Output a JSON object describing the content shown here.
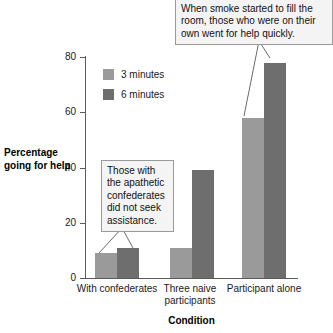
{
  "chart_data": {
    "type": "bar",
    "title": "",
    "xlabel": "Condition",
    "ylabel": "Percentage going for help",
    "categories": [
      "With confederates",
      "Three naive participants",
      "Participant alone"
    ],
    "series": [
      {
        "name": "3 minutes",
        "values": [
          9,
          11,
          58
        ],
        "color": "#9a9a9a"
      },
      {
        "name": "6 minutes",
        "values": [
          11,
          39,
          78
        ],
        "color": "#6e6e6e"
      }
    ],
    "ylim": [
      0,
      80
    ],
    "yticks": [
      0,
      20,
      40,
      60,
      80
    ],
    "ytick_labels": [
      "0",
      "20",
      "40",
      "60",
      "80"
    ],
    "grid": false,
    "legend_position": "upper-left-inside",
    "annotations": [
      {
        "id": "top",
        "text": "When smoke started to fill the room, those who were on their own went for help quickly.",
        "points_to": [
          "Participant alone / 3 minutes",
          "Participant alone / 6 minutes"
        ]
      },
      {
        "id": "bottom",
        "text": "Those with the apathetic confederates did not seek assistance.",
        "points_to": [
          "With confederates / 3 minutes",
          "With confederates / 6 minutes"
        ]
      }
    ]
  },
  "axes": {
    "y_title": "Percentage going for help",
    "x_title": "Condition"
  },
  "legend": {
    "items": [
      {
        "label": "3 minutes"
      },
      {
        "label": "6 minutes"
      }
    ]
  },
  "ticks": {
    "y": [
      "80",
      "60",
      "40",
      "20",
      "0"
    ]
  },
  "categories": [
    {
      "label": "With confederates"
    },
    {
      "label": "Three naive participants"
    },
    {
      "label": "Participant alone"
    }
  ],
  "callouts": {
    "top": {
      "text": "When smoke started to fill the room, those who were on their own went for help quickly."
    },
    "bottom": {
      "text": "Those with the apathetic confederates did not seek assistance."
    }
  },
  "colors": {
    "series_3min": "#9a9a9a",
    "series_6min": "#6e6e6e",
    "axis": "#5a5a5a",
    "callout_bg": "#f4f4f4",
    "callout_border": "#9a9a9a"
  }
}
